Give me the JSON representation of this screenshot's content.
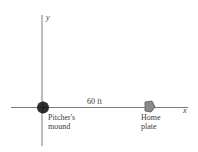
{
  "diagram": {
    "axes": {
      "x_label": "x",
      "y_label": "y"
    },
    "distance_label": "60 ft",
    "pitchers_mound": {
      "line1": "Pitcher's",
      "line2": "mound"
    },
    "home_plate": {
      "line1": "Home",
      "line2": "plate"
    },
    "colors": {
      "axis": "#7a7a7a",
      "mound": "#2e2e2e",
      "plate": "#8a8a8a",
      "text": "#3a3a3a"
    }
  }
}
